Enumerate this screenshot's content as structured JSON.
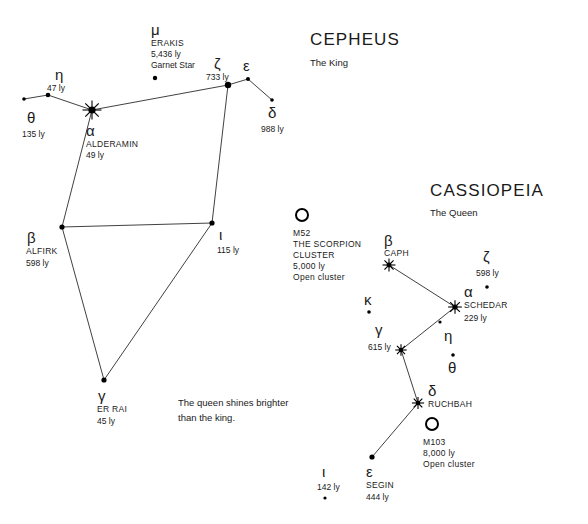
{
  "chart_data": {
    "type": "scatter",
    "xlabel": "",
    "ylabel": "",
    "grid": false,
    "legend": "none",
    "constellations": [
      {
        "name": "CEPHEUS",
        "epithet": "The King",
        "title_x": 310,
        "title_y": 45,
        "sub_x": 310,
        "sub_y": 66,
        "stars": [
          {
            "id": "cep-alpha",
            "greek": "α",
            "proper": "ALDERAMIN",
            "distance": "49 ly",
            "x": 92,
            "y": 110,
            "marker": "burst",
            "size": 5,
            "greek_x": 86,
            "greek_y": 136,
            "proper_x": 86,
            "proper_y": 147,
            "dist_x": 86,
            "dist_y": 158
          },
          {
            "id": "cep-eta",
            "greek": "η",
            "proper": "",
            "distance": "47 ly",
            "x": 48,
            "y": 95,
            "marker": "dot",
            "size": 2.3,
            "greek_x": 55,
            "greek_y": 80,
            "proper_x": 0,
            "proper_y": 0,
            "dist_x": 47,
            "dist_y": 91
          },
          {
            "id": "cep-theta",
            "greek": "θ",
            "proper": "",
            "distance": "135 ly",
            "x": 24,
            "y": 99,
            "marker": "dot",
            "size": 1.8,
            "greek_x": 27,
            "greek_y": 123,
            "proper_x": 0,
            "proper_y": 0,
            "dist_x": 22,
            "dist_y": 137
          },
          {
            "id": "cep-mu",
            "greek": "μ",
            "proper": "ERAKIS",
            "distance": "5,436 ly",
            "note": "Garnet Star",
            "x": 155,
            "y": 78,
            "marker": "dot",
            "size": 2.2,
            "greek_x": 151,
            "greek_y": 35,
            "proper_x": 151,
            "proper_y": 46,
            "dist_x": 151,
            "dist_y": 57,
            "note_x": 151,
            "note_y": 68
          },
          {
            "id": "cep-zeta",
            "greek": "ζ",
            "proper": "",
            "distance": "733 ly",
            "x": 228,
            "y": 85,
            "marker": "dot",
            "size": 3.2,
            "greek_x": 214,
            "greek_y": 69,
            "proper_x": 0,
            "proper_y": 0,
            "dist_x": 206,
            "dist_y": 80
          },
          {
            "id": "cep-epsilon",
            "greek": "ε",
            "proper": "",
            "distance": "",
            "x": 248,
            "y": 79,
            "marker": "dot",
            "size": 2,
            "greek_x": 243,
            "greek_y": 71,
            "proper_x": 0,
            "proper_y": 0,
            "dist_x": 0,
            "dist_y": 0
          },
          {
            "id": "cep-delta",
            "greek": "δ",
            "proper": "",
            "distance": "988 ly",
            "x": 272,
            "y": 100,
            "marker": "dot",
            "size": 1.8,
            "greek_x": 268,
            "greek_y": 118,
            "proper_x": 0,
            "proper_y": 0,
            "dist_x": 261,
            "dist_y": 132
          },
          {
            "id": "cep-beta",
            "greek": "β",
            "proper": "ALFIRK",
            "distance": "598 ly",
            "x": 62,
            "y": 227,
            "marker": "dot",
            "size": 2.6,
            "greek_x": 27,
            "greek_y": 243,
            "proper_x": 26,
            "proper_y": 254,
            "dist_x": 26,
            "dist_y": 266
          },
          {
            "id": "cep-iota",
            "greek": "ι",
            "proper": "",
            "distance": "115 ly",
            "x": 212,
            "y": 223,
            "marker": "dot",
            "size": 2.6,
            "greek_x": 219,
            "greek_y": 240,
            "proper_x": 0,
            "proper_y": 0,
            "dist_x": 217,
            "dist_y": 253
          },
          {
            "id": "cep-gamma",
            "greek": "γ",
            "proper": "ER RAI",
            "distance": "45 ly",
            "x": 104,
            "y": 380,
            "marker": "dot",
            "size": 2.6,
            "greek_x": 98,
            "greek_y": 401,
            "proper_x": 97,
            "proper_y": 412,
            "dist_x": 97,
            "dist_y": 424
          }
        ],
        "lines": [
          [
            "cep-theta",
            "cep-eta"
          ],
          [
            "cep-eta",
            "cep-alpha"
          ],
          [
            "cep-alpha",
            "cep-zeta"
          ],
          [
            "cep-zeta",
            "cep-epsilon"
          ],
          [
            "cep-epsilon",
            "cep-delta"
          ],
          [
            "cep-zeta",
            "cep-iota"
          ],
          [
            "cep-alpha",
            "cep-beta"
          ],
          [
            "cep-beta",
            "cep-iota"
          ],
          [
            "cep-beta",
            "cep-gamma"
          ],
          [
            "cep-gamma",
            "cep-iota"
          ]
        ]
      },
      {
        "name": "CASSIOPEIA",
        "epithet": "The Queen",
        "title_x": 430,
        "title_y": 196,
        "sub_x": 430,
        "sub_y": 216,
        "stars": [
          {
            "id": "cas-beta",
            "greek": "β",
            "proper": "CAPH",
            "distance": "",
            "x": 389,
            "y": 265,
            "marker": "burst",
            "size": 3.4,
            "greek_x": 384,
            "greek_y": 246,
            "proper_x": 384,
            "proper_y": 256,
            "dist_x": 0,
            "dist_y": 0
          },
          {
            "id": "cas-alpha",
            "greek": "α",
            "proper": "SCHEDAR",
            "distance": "229 ly",
            "x": 455,
            "y": 307,
            "marker": "burst",
            "size": 3.6,
            "greek_x": 464,
            "greek_y": 297,
            "proper_x": 464,
            "proper_y": 308,
            "dist_x": 464,
            "dist_y": 321
          },
          {
            "id": "cas-gamma",
            "greek": "γ",
            "proper": "",
            "distance": "615 ly",
            "x": 401,
            "y": 350,
            "marker": "burst",
            "size": 3,
            "greek_x": 375,
            "greek_y": 335,
            "proper_x": 0,
            "proper_y": 0,
            "dist_x": 368,
            "dist_y": 350
          },
          {
            "id": "cas-delta",
            "greek": "δ",
            "proper": "RUCHBAH",
            "distance": "",
            "x": 418,
            "y": 403,
            "marker": "burst",
            "size": 3.2,
            "greek_x": 428,
            "greek_y": 396,
            "proper_x": 428,
            "proper_y": 407,
            "dist_x": 0,
            "dist_y": 0
          },
          {
            "id": "cas-epsilon",
            "greek": "ε",
            "proper": "SEGIN",
            "distance": "444 ly",
            "x": 372,
            "y": 457,
            "marker": "dot",
            "size": 2.6,
            "greek_x": 366,
            "greek_y": 477,
            "proper_x": 366,
            "proper_y": 488,
            "dist_x": 366,
            "dist_y": 500
          },
          {
            "id": "cas-zeta",
            "greek": "ζ",
            "proper": "",
            "distance": "598 ly",
            "x": 487,
            "y": 287,
            "marker": "dot",
            "size": 1.8,
            "greek_x": 483,
            "greek_y": 262,
            "proper_x": 0,
            "proper_y": 0,
            "dist_x": 476,
            "dist_y": 276
          },
          {
            "id": "cas-kappa",
            "greek": "κ",
            "proper": "",
            "distance": "",
            "x": 369,
            "y": 312,
            "marker": "dot",
            "size": 1.8,
            "greek_x": 364,
            "greek_y": 305,
            "proper_x": 0,
            "proper_y": 0,
            "dist_x": 0,
            "dist_y": 0
          },
          {
            "id": "cas-eta",
            "greek": "η",
            "proper": "",
            "distance": "",
            "x": 440,
            "y": 322,
            "marker": "dot",
            "size": 1.6,
            "greek_x": 444,
            "greek_y": 341,
            "proper_x": 0,
            "proper_y": 0,
            "dist_x": 0,
            "dist_y": 0
          },
          {
            "id": "cas-theta",
            "greek": "θ",
            "proper": "",
            "distance": "",
            "x": 453,
            "y": 355,
            "marker": "dot",
            "size": 1.8,
            "greek_x": 448,
            "greek_y": 373,
            "proper_x": 0,
            "proper_y": 0,
            "dist_x": 0,
            "dist_y": 0
          },
          {
            "id": "cas-iota",
            "greek": "ι",
            "proper": "",
            "distance": "142 ly",
            "x": 325,
            "y": 498,
            "marker": "dot",
            "size": 1.6,
            "greek_x": 322,
            "greek_y": 477,
            "proper_x": 0,
            "proper_y": 0,
            "dist_x": 317,
            "dist_y": 490
          }
        ],
        "lines": [
          [
            "cas-beta",
            "cas-alpha"
          ],
          [
            "cas-alpha",
            "cas-gamma"
          ],
          [
            "cas-gamma",
            "cas-delta"
          ],
          [
            "cas-delta",
            "cas-epsilon"
          ]
        ]
      }
    ],
    "deep_sky_objects": [
      {
        "id": "m52",
        "marker": "ring",
        "x": 302,
        "y": 215,
        "radius": 6,
        "lines": [
          "M52",
          "THE SCORPION",
          "CLUSTER",
          "5,000 ly",
          "Open cluster"
        ],
        "label_x": 293,
        "label_y": 236,
        "line_height": 11
      },
      {
        "id": "m103",
        "marker": "ring",
        "x": 432,
        "y": 424,
        "radius": 6,
        "lines": [
          "M103",
          "8,000 ly",
          "Open cluster"
        ],
        "label_x": 423,
        "label_y": 445,
        "line_height": 11
      }
    ],
    "captions": [
      {
        "id": "queen-brighter",
        "lines": [
          "The queen shines brighter",
          "than the king."
        ],
        "x": 178,
        "y": 406,
        "line_height": 15
      }
    ]
  }
}
